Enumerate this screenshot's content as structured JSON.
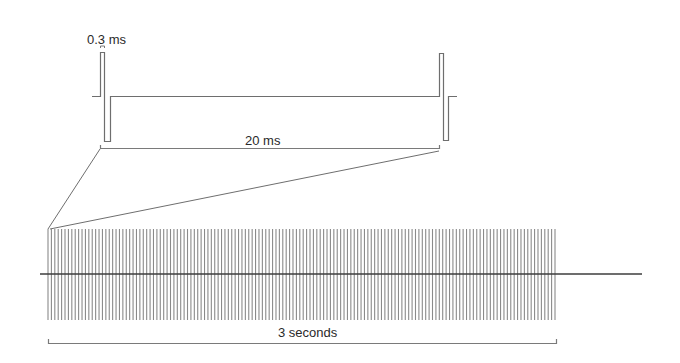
{
  "diagram": {
    "labels": {
      "pulse_width": "0.3 ms",
      "interpulse_interval": "20 ms",
      "train_duration": "3 seconds"
    },
    "colors": {
      "stroke": "#6e6e6e",
      "dark_stroke": "#3c3c3c",
      "text": "#2a2a2a",
      "background": "#ffffff"
    },
    "pulse_detail": {
      "baseline_y": 96,
      "peak_y": 52,
      "trough_y": 142,
      "pulses": [
        {
          "lead_x": 92,
          "up_x": 100,
          "mid_x": 104,
          "down_end_x": 110
        },
        {
          "lead_x": 439,
          "up_x": 439,
          "mid_x": 443,
          "down_end_x": 448,
          "tail_x": 457
        }
      ],
      "interval_bracket": {
        "x1": 100,
        "x2": 439,
        "y": 148
      }
    },
    "train": {
      "x_start": 48,
      "x_end": 555,
      "y_top": 229,
      "y_bottom": 320,
      "pulse_count": 150,
      "axis_y": 274,
      "axis_x1": 40,
      "axis_x2": 642,
      "duration_bracket": {
        "x1": 48,
        "x2": 556,
        "y": 343
      }
    }
  }
}
